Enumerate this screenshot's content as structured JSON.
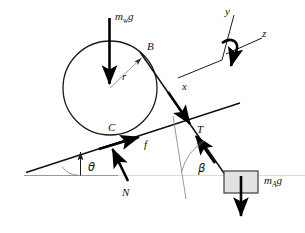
{
  "figure": {
    "background_color": "#ffffff",
    "ink_color": "#111111",
    "block_fill_color": "#e2e2e2",
    "width": 305,
    "height": 233
  },
  "labels": {
    "wheel_weight": {
      "base": "m",
      "sub": "w",
      "tail": "g",
      "full": "m_w g"
    },
    "block_weight": {
      "base": "m",
      "sub": "A",
      "tail": "g",
      "full": "m_A g"
    },
    "point_b": "B",
    "point_c": "C",
    "radius": "r",
    "tension": "T",
    "friction": "f",
    "normal": "N",
    "theta": "θ",
    "beta": "β",
    "axis_x": "x",
    "axis_y": "y",
    "axis_z": "z"
  },
  "elements": {
    "wheel": {
      "name": "wheel-circle",
      "cx": 110,
      "cy": 88,
      "r": 47
    },
    "block": {
      "name": "hanging-block",
      "x": 224,
      "y": 171,
      "width": 34,
      "height": 22
    },
    "incline_surface": {
      "name": "incline-line",
      "x1": 26,
      "y1": 172,
      "x2": 240,
      "y2": 103
    },
    "ground_line": {
      "name": "ground-reference-line",
      "x1": 24,
      "y1": 175,
      "x2": 305,
      "y2": 175
    },
    "cable": {
      "name": "cable-line",
      "from": "B",
      "to": "block"
    }
  },
  "vectors": [
    {
      "name": "wheel-weight-arrow",
      "label": "m_w g",
      "direction": "down"
    },
    {
      "name": "block-weight-arrow",
      "label": "m_A g",
      "direction": "down"
    },
    {
      "name": "friction-arrow",
      "label": "f",
      "direction": "up-incline"
    },
    {
      "name": "normal-arrow",
      "label": "N",
      "direction": "perpendicular-to-incline"
    },
    {
      "name": "tension-arrow-upper",
      "label": "T",
      "direction": "down-cable"
    },
    {
      "name": "tension-arrow-lower",
      "label": "T",
      "direction": "up-cable"
    },
    {
      "name": "radius-arrow",
      "label": "r",
      "direction": "center-to-B"
    }
  ],
  "angles": [
    {
      "name": "theta-angle",
      "label": "θ",
      "between": "ground and incline"
    },
    {
      "name": "beta-angle",
      "label": "β",
      "between": "incline-normal and cable"
    }
  ],
  "axes": [
    {
      "name": "axis-y",
      "label": "y"
    },
    {
      "name": "axis-x",
      "label": "x"
    },
    {
      "name": "axis-z",
      "label": "z",
      "has_rotation_arrow": true
    }
  ]
}
